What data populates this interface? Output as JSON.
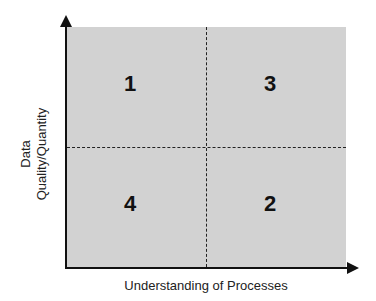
{
  "diagram": {
    "type": "quadrant",
    "x_axis_label": "Understanding of Processes",
    "y_axis_label_line1": "Data",
    "y_axis_label_line2": "Quality/Quantity",
    "quadrants": {
      "top_left": "1",
      "top_right": "3",
      "bottom_left": "4",
      "bottom_right": "2"
    },
    "colors": {
      "fill": "#d2d2d2",
      "axis": "#111111",
      "divider": "#222222"
    }
  }
}
